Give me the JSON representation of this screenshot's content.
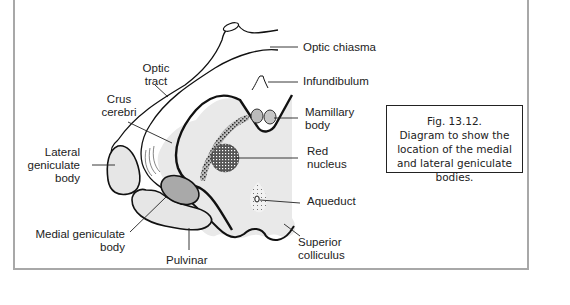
{
  "figure": {
    "caption_lines": [
      "Fig. 13.12.",
      "Diagram to show the",
      "location of the medial",
      "and lateral geniculate",
      "bodies."
    ]
  },
  "labels": {
    "optic_chiasma": "Optic chiasma",
    "optic_tract": [
      "Optic",
      "tract"
    ],
    "infundibulum": "Infundibulum",
    "crus_cerebri": [
      "Crus",
      "cerebri"
    ],
    "mamillary_body": [
      "Mamillary",
      "body"
    ],
    "lateral_geniculate_body": [
      "Lateral",
      "geniculate",
      "body"
    ],
    "red_nucleus": [
      "Red",
      "nucleus"
    ],
    "aqueduct": "Aqueduct",
    "medial_geniculate_body": [
      "Medial geniculate",
      "body"
    ],
    "pulvinar": "Pulvinar",
    "superior_colliculus": [
      "Superior",
      "colliculus"
    ]
  },
  "colors": {
    "frame": "#a8a8a8",
    "outline": "#111111",
    "fill_light": "#e6e6e6",
    "fill_medial": "#a9a9a9",
    "stipple": "#333333"
  }
}
